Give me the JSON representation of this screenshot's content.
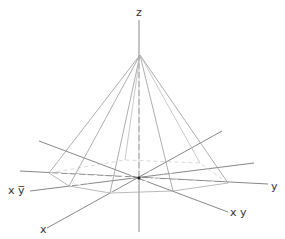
{
  "figure": {
    "type": "pyramid-diagram",
    "colors": {
      "line": "#9a9a9a",
      "axis": "#6e6e6e",
      "text": "#333333",
      "background": "#ffffff"
    },
    "labels": {
      "z": "z",
      "y": "y",
      "x": "x",
      "xy": "x y",
      "x_ybar": "x y̅"
    },
    "apex": [
      140,
      55
    ],
    "center": [
      139,
      178
    ],
    "base_vertices": [
      [
        49,
        173
      ],
      [
        69,
        186
      ],
      [
        110,
        193
      ],
      [
        173,
        191
      ],
      [
        228,
        183
      ],
      [
        200,
        163
      ],
      [
        125,
        160
      ]
    ],
    "axes": {
      "z": [
        [
          139,
          20
        ],
        [
          139,
          232
        ]
      ],
      "x": [
        [
          47,
          228
        ],
        [
          222,
          131
        ]
      ],
      "y": [
        [
          20,
          171
        ],
        [
          268,
          184
        ]
      ],
      "xy": [
        [
          39,
          141
        ],
        [
          228,
          212
        ]
      ],
      "x_ybar": [
        [
          30,
          191
        ],
        [
          254,
          163
        ]
      ]
    }
  }
}
